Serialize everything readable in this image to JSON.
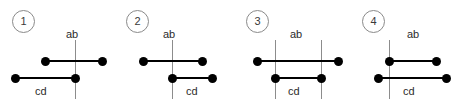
{
  "figure": {
    "width": 458,
    "height": 110,
    "background": "#ffffff",
    "line_color_horizontal": "#000000",
    "line_color_vertical": "#8c8c8c",
    "dot_color": "#000000",
    "badge_border_color": "#8a8a8a",
    "label_color": "#2b2b2b"
  },
  "panels": [
    {
      "badge": "1",
      "badge_x": 12,
      "badge_y": 10,
      "label_ab": "ab",
      "label_ab_x": 66,
      "label_ab_y": 28,
      "label_cd": "cd",
      "label_cd_x": 35,
      "label_cd_y": 85,
      "verticals": [
        {
          "x": 75,
          "y1": 40,
          "y2": 99
        }
      ],
      "segments": [
        {
          "name": "ab",
          "x1": 45,
          "x2": 102,
          "y": 61
        },
        {
          "name": "cd",
          "x1": 15,
          "x2": 75,
          "y": 78
        }
      ],
      "dots": [
        {
          "x": 45,
          "y": 61
        },
        {
          "x": 102,
          "y": 61
        },
        {
          "x": 15,
          "y": 78
        },
        {
          "x": 75,
          "y": 78
        }
      ]
    },
    {
      "badge": "2",
      "badge_x": 126,
      "badge_y": 10,
      "label_ab": "ab",
      "label_ab_x": 163,
      "label_ab_y": 28,
      "label_cd": "cd",
      "label_cd_x": 186,
      "label_cd_y": 85,
      "verticals": [
        {
          "x": 172,
          "y1": 40,
          "y2": 99
        }
      ],
      "segments": [
        {
          "name": "ab",
          "x1": 143,
          "x2": 202,
          "y": 61
        },
        {
          "name": "cd",
          "x1": 172,
          "x2": 212,
          "y": 78
        }
      ],
      "dots": [
        {
          "x": 143,
          "y": 61
        },
        {
          "x": 202,
          "y": 61
        },
        {
          "x": 172,
          "y": 78
        },
        {
          "x": 212,
          "y": 78
        }
      ]
    },
    {
      "badge": "3",
      "badge_x": 246,
      "badge_y": 10,
      "label_ab": "ab",
      "label_ab_x": 290,
      "label_ab_y": 28,
      "label_cd": "cd",
      "label_cd_x": 288,
      "label_cd_y": 85,
      "verticals": [
        {
          "x": 275,
          "y1": 40,
          "y2": 99
        },
        {
          "x": 321,
          "y1": 40,
          "y2": 99
        }
      ],
      "segments": [
        {
          "name": "ab",
          "x1": 257,
          "x2": 338,
          "y": 61
        },
        {
          "name": "cd",
          "x1": 275,
          "x2": 321,
          "y": 78
        }
      ],
      "dots": [
        {
          "x": 257,
          "y": 61
        },
        {
          "x": 338,
          "y": 61
        },
        {
          "x": 275,
          "y": 78
        },
        {
          "x": 321,
          "y": 78
        }
      ]
    },
    {
      "badge": "4",
      "badge_x": 362,
      "badge_y": 10,
      "label_ab": "ab",
      "label_ab_x": 407,
      "label_ab_y": 28,
      "label_cd": "cd",
      "label_cd_x": 403,
      "label_cd_y": 85,
      "verticals": [
        {
          "x": 389,
          "y1": 40,
          "y2": 99
        }
      ],
      "segments": [
        {
          "name": "ab",
          "x1": 389,
          "x2": 436,
          "y": 61
        },
        {
          "name": "cd",
          "x1": 378,
          "x2": 446,
          "y": 78
        }
      ],
      "dots": [
        {
          "x": 389,
          "y": 61
        },
        {
          "x": 436,
          "y": 61
        },
        {
          "x": 378,
          "y": 78
        },
        {
          "x": 446,
          "y": 78
        }
      ]
    }
  ]
}
